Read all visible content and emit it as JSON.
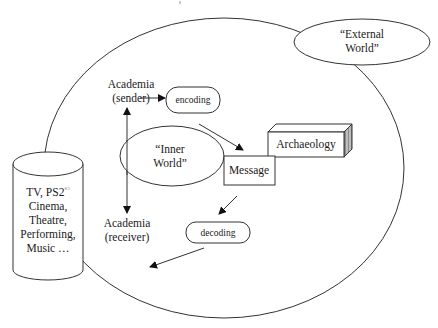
{
  "diagram": {
    "type": "communication-model",
    "nodes": {
      "external_world": {
        "line1": "“External",
        "line2": "World”"
      },
      "inner_world": {
        "line1": "“Inner",
        "line2": "World”"
      },
      "sender": {
        "line1": "Academia",
        "line2": "(sender)"
      },
      "receiver": {
        "line1": "Academia",
        "line2": "(receiver)"
      },
      "encoding": {
        "label": "encoding"
      },
      "decoding": {
        "label": "decoding"
      },
      "message": {
        "label": "Message"
      },
      "archaeology": {
        "label": "Archaeology"
      },
      "media": {
        "line1": "TV, PS2",
        "line1_sup": "©",
        "line2": "Cinema,",
        "line3": "Theatre,",
        "line4": "Performing,",
        "line5": "Music …"
      }
    },
    "edges": [
      {
        "from": "sender",
        "to": "encoding"
      },
      {
        "from": "encoding",
        "to": "message"
      },
      {
        "from": "message",
        "to": "decoding"
      },
      {
        "from": "decoding",
        "to": "media"
      },
      {
        "from": "inner_world",
        "to": "sender"
      },
      {
        "from": "inner_world",
        "to": "receiver"
      }
    ],
    "colors": {
      "line": "#333333",
      "background": "#ffffff",
      "shade": "#8a8a8a"
    }
  }
}
